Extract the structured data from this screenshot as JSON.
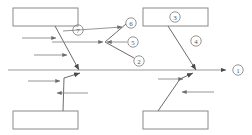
{
  "diagram": {
    "type": "fishbone-ishikawa",
    "title": "",
    "background_color": "#ffffff",
    "line_color": "#8a8a8a",
    "label_color": "#555555",
    "width": 252,
    "height": 135,
    "spine": {
      "name": "main-spine",
      "x1": 8,
      "y1": 70,
      "x2": 226,
      "y2": 70,
      "arrowhead": true
    },
    "boxes": [
      {
        "id": "box-top-left",
        "label": "",
        "x": 13,
        "y": 8,
        "w": 65,
        "h": 18
      },
      {
        "id": "box-top-right",
        "label": "",
        "x": 143,
        "y": 8,
        "w": 65,
        "h": 18
      },
      {
        "id": "box-bottom-left",
        "label": "",
        "x": 13,
        "y": 111,
        "w": 65,
        "h": 18
      },
      {
        "id": "box-bottom-right",
        "label": "",
        "x": 143,
        "y": 111,
        "w": 65,
        "h": 18
      }
    ],
    "labels": [
      {
        "id": "label-1",
        "text": "1",
        "cx": 238,
        "cy": 70
      },
      {
        "id": "label-2",
        "text": "2",
        "cx": 139,
        "cy": 61
      },
      {
        "id": "label-3",
        "text": "3",
        "cx": 175,
        "cy": 17
      },
      {
        "id": "label-4",
        "text": "4",
        "cx": 196,
        "cy": 41
      },
      {
        "id": "label-5",
        "text": "5",
        "cx": 133,
        "cy": 42
      },
      {
        "id": "label-6",
        "text": "6",
        "cx": 131,
        "cy": 23
      },
      {
        "id": "label-7",
        "text": "7",
        "cx": 78,
        "cy": 30
      }
    ],
    "branches": [
      {
        "id": "branch-top-left",
        "x1": 55,
        "y1": 26,
        "x2": 79,
        "y2": 70,
        "arrowhead": true
      },
      {
        "id": "branch-top-right",
        "x1": 168,
        "y1": 26,
        "x2": 196,
        "y2": 70,
        "arrowhead": true
      },
      {
        "id": "branch-bottom-left",
        "x1": 63,
        "y1": 111,
        "x2": 64,
        "y2": 75,
        "arrowhead": true
      },
      {
        "id": "branch-bottom-right",
        "x1": 158,
        "y1": 111,
        "x2": 186,
        "y2": 75,
        "arrowhead": true
      }
    ],
    "twigs": [
      {
        "id": "twig-tl-upper",
        "x1": 22,
        "y1": 38,
        "x2": 57,
        "y2": 38
      },
      {
        "id": "twig-tl-lower",
        "x1": 34,
        "y1": 55,
        "x2": 66,
        "y2": 55
      },
      {
        "id": "twig-bl-upper",
        "x1": 28,
        "y1": 81,
        "x2": 58,
        "y2": 81
      },
      {
        "id": "twig-bl-lower",
        "x1": 87,
        "y1": 93,
        "x2": 57,
        "y2": 93
      },
      {
        "id": "twig-br-upper",
        "x1": 158,
        "y1": 79,
        "x2": 182,
        "y2": 79
      },
      {
        "id": "twig-br-lower",
        "x1": 213,
        "y1": 92,
        "x2": 182,
        "y2": 92
      },
      {
        "id": "twig-mid-in-left",
        "x1": 63,
        "y1": 31,
        "x2": 117,
        "y2": 31
      },
      {
        "id": "twig-mid-in-horiz",
        "x1": 52,
        "y1": 42,
        "x2": 105,
        "y2": 42
      },
      {
        "id": "twig-mid-out-right",
        "x1": 127,
        "y1": 42,
        "x2": 106,
        "y2": 42
      }
    ],
    "mid_vertex": {
      "id": "mid-vertex",
      "x": 105,
      "y": 42
    },
    "mid_arms": [
      {
        "id": "mid-arm-up",
        "x1": 105,
        "y1": 42,
        "x2": 126,
        "y2": 24
      },
      {
        "id": "mid-arm-down",
        "x1": 105,
        "y1": 42,
        "x2": 134,
        "y2": 58
      }
    ]
  }
}
